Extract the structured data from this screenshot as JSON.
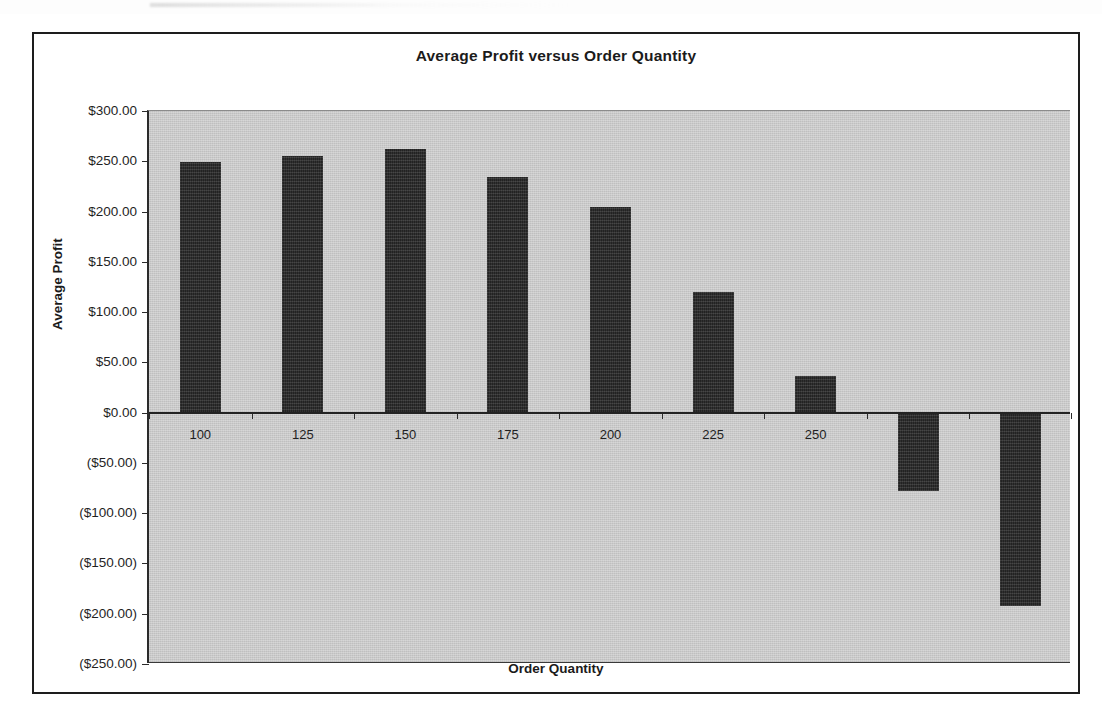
{
  "chart_data": {
    "type": "bar",
    "title": "Average Profit versus Order Quantity",
    "xlabel": "Order Quantity",
    "ylabel": "Average Profit",
    "categories": [
      "100",
      "125",
      "150",
      "175",
      "200",
      "225",
      "250",
      "275",
      "300"
    ],
    "visible_tick_labels": [
      "100",
      "125",
      "150",
      "175",
      "200",
      "225",
      "250"
    ],
    "values": [
      249.0,
      255.0,
      262.0,
      234.0,
      205.0,
      120.0,
      36.0,
      -78.0,
      -192.0
    ],
    "ylim": [
      -250,
      300
    ],
    "ytick_values": [
      300,
      250,
      200,
      150,
      100,
      50,
      0,
      -50,
      -100,
      -150,
      -200,
      -250
    ],
    "ytick_labels": [
      "$300.00",
      "$250.00",
      "$200.00",
      "$150.00",
      "$100.00",
      "$50.00",
      "$0.00",
      "($50.00)",
      "($100.00)",
      "($150.00)",
      "($200.00)",
      "($250.00)"
    ],
    "grid": false,
    "legend": false,
    "plot_background_color": "#c9c9c9",
    "bar_color": "#2e2e2e",
    "axis_color": "#232323",
    "note_hidden_labels": "Category labels 275 and 300 are obscured by the downward (negative) bars drawn over the category axis."
  }
}
